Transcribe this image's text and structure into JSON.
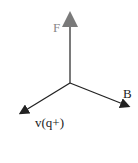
{
  "diagram": {
    "title": "",
    "vectors": [
      {
        "id": "F",
        "label": "F",
        "color": "#7a7a7a"
      },
      {
        "id": "B",
        "label": "B",
        "color": "#222222"
      },
      {
        "id": "v",
        "label": "v(q+)",
        "color": "#222222"
      }
    ]
  }
}
